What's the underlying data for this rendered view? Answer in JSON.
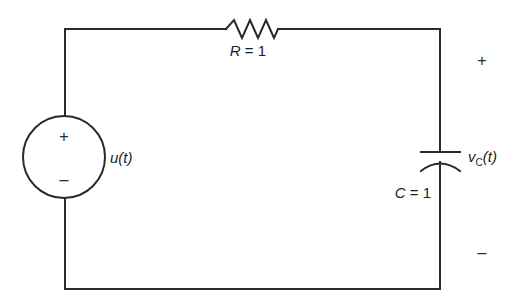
{
  "diagram": {
    "type": "RC circuit schematic",
    "colors": {
      "line": "#2a2a2a",
      "text": "#1e1e1e",
      "background": "#ffffff"
    },
    "source": {
      "label": "u(t)",
      "plus": "+",
      "minus": "–"
    },
    "resistor": {
      "label": "R = 1",
      "symbol": "R",
      "value": "1"
    },
    "capacitor": {
      "label": "C = 1",
      "symbol": "C",
      "value": "1",
      "voltage_label": "v",
      "voltage_subscript": "C",
      "voltage_suffix": "(t)"
    },
    "output_polarity": {
      "plus": "+",
      "minus": "–"
    }
  }
}
